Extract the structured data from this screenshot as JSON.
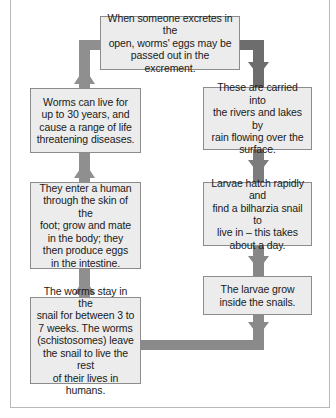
{
  "diagram": {
    "title": "",
    "type": "cycle",
    "colors": {
      "box_fill": "#ececec",
      "box_border": "#8c8c8c",
      "arrow_left": "#8f8f8f",
      "arrow_right": "#6d6d6d",
      "arrow_bottom": "#8a8a8a"
    },
    "steps": [
      {
        "id": "excrete",
        "text": "When someone excretes in the\nopen, worms' eggs may be\npassed out in the excrement."
      },
      {
        "id": "carried",
        "text": "These are carried into\nthe rivers and lakes by\nrain flowing over the\nsurface."
      },
      {
        "id": "hatch",
        "text": "Larvae hatch rapidly and\nfind a bilharzia snail to\nlive in – this takes\nabout a day."
      },
      {
        "id": "grow",
        "text": "The larvae grow\ninside the snails."
      },
      {
        "id": "stay",
        "text": "The worms stay in the\nsnail for between 3 to\n7 weeks. The worms\n(schistosomes) leave\nthe snail to live the rest\nof their lives in humans."
      },
      {
        "id": "enter",
        "text": "They enter a human\nthrough the skin of the\nfoot; grow and mate\nin the body; they\nthen produce eggs\nin the intestine."
      },
      {
        "id": "live",
        "text": "Worms can live for\nup to 30 years, and\ncause a range of life\nthreatening diseases."
      }
    ],
    "flow": [
      [
        "excrete",
        "carried"
      ],
      [
        "carried",
        "hatch"
      ],
      [
        "hatch",
        "grow"
      ],
      [
        "grow",
        "stay"
      ],
      [
        "stay",
        "enter"
      ],
      [
        "enter",
        "live"
      ],
      [
        "live",
        "excrete"
      ]
    ]
  }
}
